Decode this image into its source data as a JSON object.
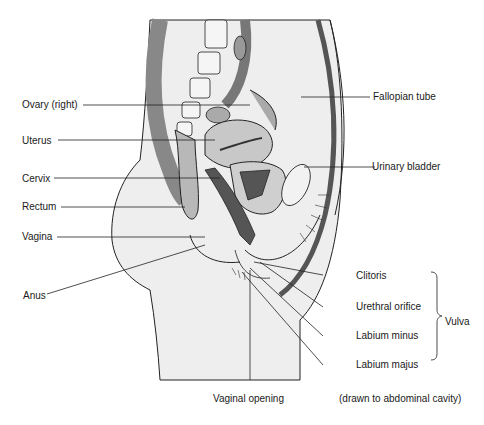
{
  "diagram": {
    "type": "anatomical-sagittal-section",
    "labels_left": [
      {
        "id": "ovary",
        "text": "Ovary (right)"
      },
      {
        "id": "uterus",
        "text": "Uterus"
      },
      {
        "id": "cervix",
        "text": "Cervix"
      },
      {
        "id": "rectum",
        "text": "Rectum"
      },
      {
        "id": "vagina",
        "text": "Vagina"
      },
      {
        "id": "anus",
        "text": "Anus"
      }
    ],
    "labels_right": [
      {
        "id": "fallopian",
        "text": "Fallopian tube"
      },
      {
        "id": "bladder",
        "text": "Urinary bladder"
      },
      {
        "id": "clitoris",
        "text": "Clitoris"
      },
      {
        "id": "urethral",
        "text": "Urethral orifice"
      },
      {
        "id": "labium_minus",
        "text": "Labium minus"
      },
      {
        "id": "labium_majus",
        "text": "Labium majus"
      }
    ],
    "labels_bottom": [
      {
        "id": "vaginal_opening",
        "text": "Vaginal opening"
      }
    ],
    "group_label": "Vulva",
    "footnote": "(drawn to abdominal cavity)"
  },
  "colors": {
    "line": "#222222",
    "body_fill": "#eeeeee",
    "organ_fill": "#bdbdbd",
    "dark_fill": "#555555"
  }
}
